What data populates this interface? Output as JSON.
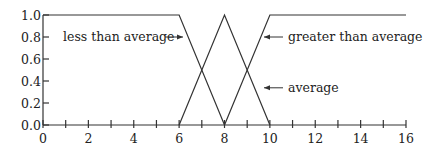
{
  "chart_data": {
    "type": "line",
    "title": "",
    "xlabel": "",
    "ylabel": "",
    "xlim": [
      0,
      16
    ],
    "ylim": [
      0,
      1
    ],
    "grid": false,
    "x_ticks": [
      0,
      2,
      4,
      6,
      8,
      10,
      12,
      14,
      16
    ],
    "x_tick_labels": [
      "0",
      "2",
      "4",
      "6",
      "8",
      "10",
      "12",
      "14",
      "16"
    ],
    "x_minor_ticks": [
      1,
      3,
      5,
      7,
      9,
      11,
      13,
      15
    ],
    "y_ticks": [
      0.0,
      0.2,
      0.4,
      0.6,
      0.8,
      1.0
    ],
    "y_tick_labels": [
      "0.0",
      "0.2",
      "0.4",
      "0.6",
      "0.8",
      "1.0"
    ],
    "series": [
      {
        "name": "less than average",
        "x": [
          0,
          6,
          8
        ],
        "y": [
          1.0,
          1.0,
          0.0
        ]
      },
      {
        "name": "average",
        "x": [
          6,
          8,
          10
        ],
        "y": [
          0.0,
          1.0,
          0.0
        ]
      },
      {
        "name": "greater than average",
        "x": [
          8,
          10,
          16
        ],
        "y": [
          0.0,
          1.0,
          1.0
        ]
      }
    ],
    "annotations": [
      {
        "text": "less than average",
        "arrow_to": "less than average",
        "y": 0.8
      },
      {
        "text": "greater than average",
        "arrow_to": "greater than average",
        "y": 0.8
      },
      {
        "text": "average",
        "arrow_to": "average",
        "y": 0.32
      }
    ],
    "line_color": "#333333"
  }
}
